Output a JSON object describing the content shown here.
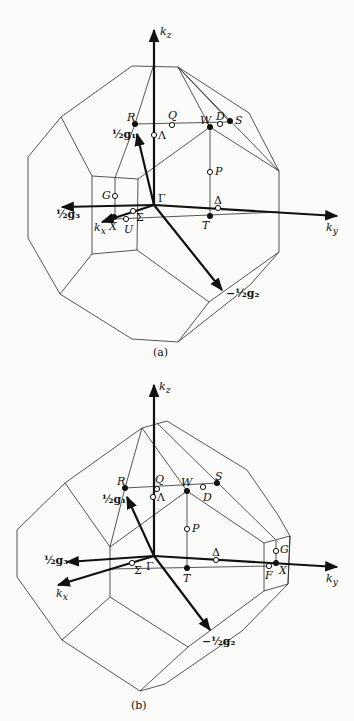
{
  "figure": {
    "panel_a": {
      "caption": "(a)",
      "axes": {
        "kz": "k",
        "kz_sub": "z",
        "ky": "k",
        "ky_sub": "y",
        "kx": "k",
        "kx_sub": "x"
      },
      "vectors": {
        "g1": "½g₁",
        "g2": "−½g₂",
        "g3": "½g₃"
      },
      "points": {
        "Gamma": "Γ",
        "R": "R",
        "Q": "Q",
        "W": "W",
        "D": "D",
        "S": "S",
        "Lambda": "Λ",
        "P": "P",
        "Delta": "Δ",
        "T": "T",
        "G": "G",
        "X": "X",
        "U": "U",
        "Sigma": "Σ"
      }
    },
    "panel_b": {
      "caption": "(b)",
      "axes": {
        "kz": "k",
        "kz_sub": "z",
        "ky": "k",
        "ky_sub": "y",
        "kx": "k",
        "kx_sub": "x"
      },
      "vectors": {
        "g1": "½g₁",
        "g2": "−½g₂",
        "g3": "½g₃"
      },
      "points": {
        "Gamma": "Γ",
        "R": "R",
        "Q": "Q",
        "W": "W",
        "D": "D",
        "S": "S",
        "Lambda": "Λ",
        "P": "P",
        "Delta": "Δ",
        "T": "T",
        "G": "G",
        "X": "X",
        "F": "F",
        "Sigma": "Σ"
      }
    }
  }
}
